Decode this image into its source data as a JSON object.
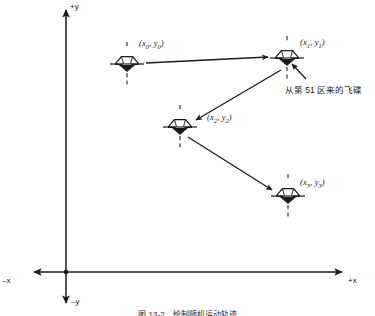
{
  "figure": {
    "axes": {
      "x_positive_label": "+x",
      "x_negative_label": "–x",
      "y_positive_label": "+y",
      "y_negative_label": "–y",
      "origin_marker": "origin-dot"
    },
    "points": [
      {
        "id": "p0",
        "label_open": "(",
        "label_var_x": "x",
        "label_sub_x": "0",
        "label_sep": ", ",
        "label_var_y": "y",
        "label_sub_y": "0",
        "label_close": ")",
        "label_text": "(x0, y0)",
        "cx": 127,
        "cy": 64,
        "label_x": 139,
        "label_y": 38
      },
      {
        "id": "p1",
        "label_open": "(",
        "label_var_x": "x",
        "label_sub_x": "1",
        "label_sep": ", ",
        "label_var_y": "y",
        "label_sub_y": "1",
        "label_close": ")",
        "label_text": "(x1, y1)",
        "cx": 287,
        "cy": 58,
        "label_x": 300,
        "label_y": 37
      },
      {
        "id": "p2",
        "label_open": "(",
        "label_var_x": "x",
        "label_sub_x": "2",
        "label_sep": ", ",
        "label_var_y": "y",
        "label_sub_y": "2",
        "label_close": ")",
        "label_text": "(x2, y2)",
        "cx": 180,
        "cy": 127,
        "label_x": 207,
        "label_y": 112
      },
      {
        "id": "p3",
        "label_open": "(",
        "label_var_x": "x",
        "label_sub_x": "3",
        "label_sep": ", ",
        "label_var_y": "y",
        "label_sub_y": "3",
        "label_close": ")",
        "label_text": "(x3, y3)",
        "cx": 288,
        "cy": 196,
        "label_x": 300,
        "label_y": 177
      }
    ],
    "annotation": {
      "text": "从第 51 区来的飞碟",
      "x": 285,
      "y": 83
    },
    "caption": {
      "text": "图 13-2　绘制随机运动轨迹"
    },
    "colors": {
      "stroke": "#1a1a1a",
      "background": "#ffffff",
      "dashed": "#3a3a3a"
    }
  }
}
